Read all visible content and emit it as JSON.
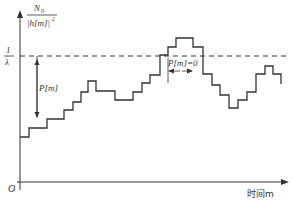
{
  "diagram": {
    "type": "staircase-waterfilling",
    "y_axis_label_numerator": "N",
    "y_axis_label_numerator_sub": "0",
    "y_axis_label_denominator": "|h[m]|",
    "y_axis_label_denominator_sup": "2",
    "threshold_label_num": "1",
    "threshold_label_den": "λ",
    "power_label": "P[m]",
    "zero_power_label": "P[m]=0",
    "origin_label": "O",
    "x_axis_label": "时间m",
    "colors": {
      "line": "#333333",
      "dashed": "#333333",
      "background": "#ffffff"
    },
    "staircase_levels": [
      137,
      128,
      119,
      110,
      102,
      92,
      81,
      91,
      100,
      92,
      83,
      75,
      55,
      47,
      38,
      47,
      74,
      85,
      95,
      108,
      100,
      92,
      74,
      66,
      74,
      84
    ]
  }
}
